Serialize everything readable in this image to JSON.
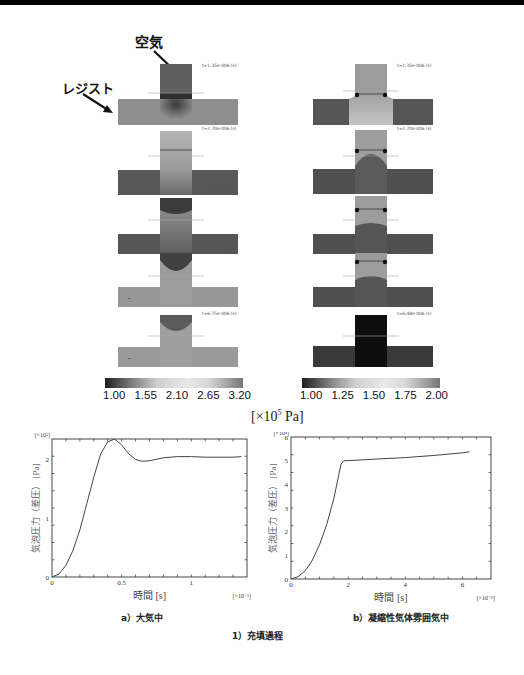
{
  "figure": {
    "annotations": {
      "air": "空気",
      "resist": "レジスト"
    },
    "left_column": {
      "timestamps": [
        "t=1.35e-006 (s)",
        "t=2.70e-006 (s)",
        "t=4.05e-006 (s)",
        "t=5.40e-006 (s)",
        "t=6.75e-006 (s)"
      ],
      "colorbar_ticks": [
        "1.00",
        "1.55",
        "2.10",
        "2.65",
        "3.20"
      ]
    },
    "right_column": {
      "timestamps": [
        "t=1.35e-006 (s)",
        "t=2.70e-006 (s)",
        "t=4.05e-006 (s)",
        "t=5.40e-006 (s)",
        "t=6.48e-006 (s)"
      ],
      "colorbar_ticks": [
        "1.00",
        "1.25",
        "1.50",
        "1.75",
        "2.00"
      ]
    },
    "colorbar_unit": "[×10⁵ Pa]",
    "unit_main": "[×10",
    "unit_exp": "5",
    "unit_tail": " Pa]",
    "caption_a": "a）大気中",
    "caption_b": "b）凝縮性気体雰囲気中",
    "caption_main": "1）充填過程"
  },
  "chart_data": [
    {
      "type": "line",
      "title": "a）大気中",
      "xlabel": "時間 [s]",
      "x_multiplier": "[×10⁻⁵]",
      "ylabel": "気泡圧力（差圧） [Pa]",
      "y_multiplier": "[×10⁵]",
      "xlim": [
        0,
        1.4
      ],
      "ylim": [
        0,
        2.35
      ],
      "x_ticks": [
        "0",
        "0.5",
        "1"
      ],
      "y_ticks": [
        "0",
        "1",
        "2"
      ],
      "grid": false,
      "x": [
        0,
        0.05,
        0.1,
        0.15,
        0.2,
        0.25,
        0.3,
        0.35,
        0.4,
        0.45,
        0.5,
        0.55,
        0.6,
        0.65,
        0.7,
        0.8,
        0.9,
        1.0,
        1.1,
        1.2,
        1.3,
        1.36
      ],
      "values": [
        0,
        0.05,
        0.2,
        0.45,
        0.8,
        1.25,
        1.7,
        2.1,
        2.3,
        2.35,
        2.25,
        2.1,
        2.0,
        1.97,
        1.98,
        2.03,
        2.05,
        2.05,
        2.04,
        2.04,
        2.04,
        2.05
      ]
    },
    {
      "type": "line",
      "title": "b）凝縮性気体雰囲気中",
      "xlabel": "時間 [s]",
      "x_multiplier": "[×10⁻⁶]",
      "ylabel": "気泡圧力（差圧） [Pa]",
      "y_multiplier": "[×10⁴]",
      "xlim": [
        0,
        7
      ],
      "ylim": [
        0,
        6
      ],
      "x_ticks": [
        "0",
        "2",
        "4",
        "6"
      ],
      "y_ticks": [
        "0",
        "1",
        "2",
        "3",
        "4",
        "5",
        "6"
      ],
      "grid": false,
      "x": [
        0,
        0.25,
        0.5,
        0.75,
        1.0,
        1.25,
        1.5,
        1.75,
        1.85,
        2.0,
        3.0,
        4.0,
        5.0,
        6.0,
        6.25
      ],
      "values": [
        0,
        0.1,
        0.35,
        0.8,
        1.45,
        2.3,
        3.4,
        4.85,
        5.0,
        5.0,
        5.07,
        5.13,
        5.22,
        5.33,
        5.38
      ]
    }
  ]
}
